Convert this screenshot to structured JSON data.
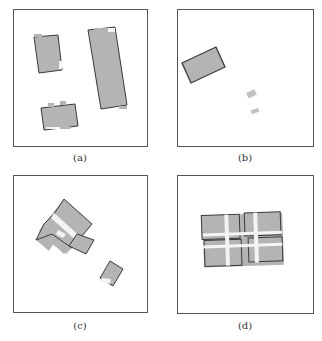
{
  "figure": {
    "panels": [
      {
        "id": "a",
        "caption": "(a)"
      },
      {
        "id": "b",
        "caption": "(b)"
      },
      {
        "id": "c",
        "caption": "(c)"
      },
      {
        "id": "d",
        "caption": "(d)"
      }
    ]
  },
  "colors": {
    "fill": "#b4b4b4",
    "outline": "#3a3a3a",
    "frame": "#555555",
    "gap": "#f4f4f4"
  }
}
